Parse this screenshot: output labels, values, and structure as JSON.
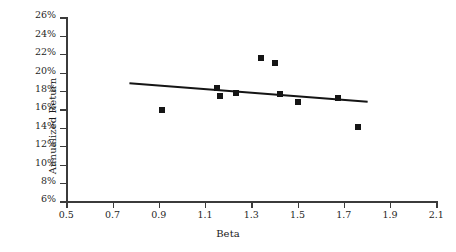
{
  "chart_data": {
    "type": "scatter",
    "title": "",
    "xlabel": "Beta",
    "ylabel": "Annualized Return",
    "xlim": [
      0.5,
      2.1
    ],
    "ylim": [
      6,
      26
    ],
    "grid": false,
    "legend": null,
    "x_ticks": [
      "0.5",
      "0.7",
      "0.9",
      "1.1",
      "1.3",
      "1.5",
      "1.7",
      "1.9",
      "2.1"
    ],
    "x_tick_values": [
      0.5,
      0.7,
      0.9,
      1.1,
      1.3,
      1.5,
      1.7,
      1.9,
      2.1
    ],
    "y_ticks": [
      "6%",
      "8%",
      "10%",
      "12%",
      "14%",
      "16%",
      "18%",
      "20%",
      "22%",
      "24%",
      "26%"
    ],
    "y_tick_values": [
      6,
      8,
      10,
      12,
      14,
      16,
      18,
      20,
      22,
      24,
      26
    ],
    "series": [
      {
        "name": "Portfolios",
        "marker": "square",
        "color": "#151515",
        "points": [
          {
            "x": 0.91,
            "y": 16.0
          },
          {
            "x": 1.15,
            "y": 18.4
          },
          {
            "x": 1.16,
            "y": 17.5
          },
          {
            "x": 1.23,
            "y": 17.9
          },
          {
            "x": 1.34,
            "y": 21.7
          },
          {
            "x": 1.4,
            "y": 21.1
          },
          {
            "x": 1.42,
            "y": 17.7
          },
          {
            "x": 1.5,
            "y": 16.9
          },
          {
            "x": 1.67,
            "y": 17.3
          },
          {
            "x": 1.76,
            "y": 14.2
          }
        ]
      }
    ],
    "trendline": {
      "name": "Linear fit",
      "color": "#151515",
      "x_start": 0.77,
      "y_start": 18.9,
      "x_end": 1.8,
      "y_end": 16.9
    }
  },
  "axes": {
    "x_title": "Beta",
    "y_title": "Annualized Return"
  },
  "colors": {
    "axis": "#3b3b3b",
    "marker": "#151515",
    "trend": "#151515",
    "background": "#ffffff"
  }
}
